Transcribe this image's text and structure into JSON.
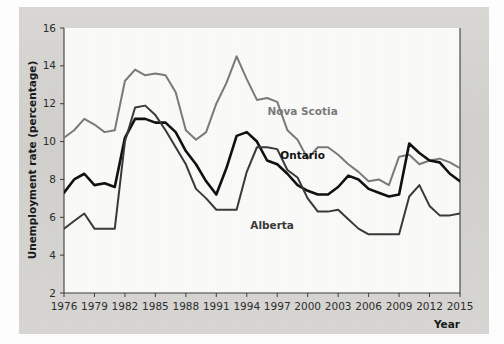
{
  "chart_data": {
    "type": "line",
    "title": "",
    "xlabel": "Year",
    "ylabel": "Unemployment rate (percentage)",
    "xlim": [
      1976,
      2015
    ],
    "ylim": [
      2,
      16
    ],
    "xticks": [
      1976,
      1979,
      1982,
      1985,
      1988,
      1991,
      1994,
      1997,
      2000,
      2003,
      2006,
      2009,
      2012,
      2015
    ],
    "yticks": [
      2,
      4,
      6,
      8,
      10,
      12,
      14,
      16
    ],
    "grid": false,
    "legend_position": "inline-annotations",
    "x": [
      1976,
      1977,
      1978,
      1979,
      1980,
      1981,
      1982,
      1983,
      1984,
      1985,
      1986,
      1987,
      1988,
      1989,
      1990,
      1991,
      1992,
      1993,
      1994,
      1995,
      1996,
      1997,
      1998,
      1999,
      2000,
      2001,
      2002,
      2003,
      2004,
      2005,
      2006,
      2007,
      2008,
      2009,
      2010,
      2011,
      2012,
      2013,
      2014,
      2015
    ],
    "series": [
      {
        "name": "Nova Scotia",
        "color": "#7b7b7b",
        "width": 2.0,
        "values": [
          10.2,
          10.6,
          11.2,
          10.9,
          10.5,
          10.6,
          13.2,
          13.8,
          13.5,
          13.6,
          13.5,
          12.6,
          10.6,
          10.1,
          10.5,
          12.0,
          13.1,
          14.5,
          13.3,
          12.2,
          12.3,
          12.1,
          10.6,
          10.1,
          9.1,
          9.7,
          9.7,
          9.3,
          8.8,
          8.4,
          7.9,
          8.0,
          7.7,
          9.2,
          9.3,
          8.8,
          9.0,
          9.1,
          8.9,
          8.6
        ],
        "label_position": {
          "x": 1999.5,
          "y": 11.4
        }
      },
      {
        "name": "Ontario",
        "color": "#111111",
        "width": 2.6,
        "values": [
          7.3,
          8.0,
          8.3,
          7.7,
          7.8,
          7.6,
          10.2,
          11.2,
          11.2,
          11.0,
          11.0,
          10.5,
          9.5,
          8.8,
          7.9,
          7.2,
          8.6,
          10.3,
          10.5,
          10.0,
          9.0,
          8.8,
          8.3,
          7.7,
          7.4,
          7.2,
          7.2,
          7.6,
          8.2,
          8.0,
          7.5,
          7.3,
          7.1,
          7.2,
          9.9,
          9.4,
          9.0,
          8.9,
          8.3,
          7.9
        ],
        "label_position": {
          "x": 1999.5,
          "y": 9.1
        }
      },
      {
        "name": "Alberta",
        "color": "#3a3a3a",
        "width": 2.0,
        "values": [
          5.4,
          5.8,
          6.2,
          5.4,
          5.4,
          5.4,
          10.0,
          11.8,
          11.9,
          11.4,
          10.6,
          9.7,
          8.8,
          7.5,
          7.0,
          6.4,
          6.4,
          6.4,
          8.4,
          9.7,
          9.7,
          9.6,
          8.5,
          8.1,
          7.0,
          6.3,
          6.3,
          6.4,
          5.9,
          5.4,
          5.1,
          5.1,
          5.1,
          5.1,
          7.1,
          7.7,
          6.6,
          6.1,
          6.1,
          6.2
        ],
        "label_position": {
          "x": 1996.5,
          "y": 5.4
        }
      }
    ]
  },
  "labels": {
    "y_axis_title": "Unemployment rate (percentage)",
    "x_axis_title": "Year",
    "y_ticks": [
      "2",
      "4",
      "6",
      "8",
      "10",
      "12",
      "14",
      "16"
    ],
    "x_ticks": [
      "1976",
      "1979",
      "1982",
      "1985",
      "1988",
      "1991",
      "1994",
      "1997",
      "2000",
      "2003",
      "2006",
      "2009",
      "2012",
      "2015"
    ],
    "series_names": [
      "Nova Scotia",
      "Ontario",
      "Alberta"
    ]
  },
  "colors": {
    "figure_background": "#d6d5d1",
    "page_background": "#ffffff",
    "plot_background": "#fbfbf9",
    "axis": "#3f3f3f",
    "nova_scotia": "#7b7b7b",
    "ontario": "#111111",
    "alberta": "#3a3a3a"
  }
}
